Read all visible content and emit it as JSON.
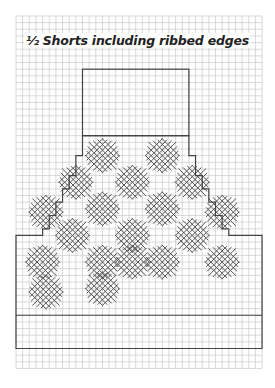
{
  "title": "½ Shorts including ribbed edges",
  "colors": {
    "grid": "#c8c8c8",
    "outline": "#444444",
    "motif": "#555555",
    "background": "#ffffff"
  },
  "grid": {
    "x0": 16,
    "y0": 16,
    "cols": 37,
    "rows": 53,
    "cell": 6.65
  },
  "outline": {
    "waistband": {
      "c0": 10,
      "r0": 8,
      "c1": 26,
      "r1": 18
    },
    "body_left_steps": [
      [
        10,
        18
      ],
      [
        10,
        21
      ],
      [
        9,
        21
      ],
      [
        9,
        24
      ],
      [
        8,
        24
      ],
      [
        8,
        26
      ],
      [
        7,
        26
      ],
      [
        7,
        28
      ],
      [
        6,
        28
      ],
      [
        6,
        30
      ],
      [
        5,
        30
      ],
      [
        5,
        32
      ],
      [
        4,
        32
      ],
      [
        4,
        33
      ],
      [
        0,
        33
      ]
    ],
    "body_right_steps": [
      [
        26,
        18
      ],
      [
        26,
        21
      ],
      [
        27,
        21
      ],
      [
        27,
        24
      ],
      [
        28,
        24
      ],
      [
        28,
        26
      ],
      [
        29,
        26
      ],
      [
        29,
        28
      ],
      [
        30,
        28
      ],
      [
        30,
        30
      ],
      [
        31,
        30
      ],
      [
        31,
        32
      ],
      [
        32,
        32
      ],
      [
        32,
        33
      ],
      [
        37,
        33
      ]
    ],
    "rib_top_row": 45,
    "bottom_row": 50
  },
  "motifs": [
    {
      "c": 13,
      "r": 21
    },
    {
      "c": 22,
      "r": 21
    },
    {
      "c": 9,
      "r": 25
    },
    {
      "c": 17.5,
      "r": 25
    },
    {
      "c": 26.5,
      "r": 25
    },
    {
      "c": 4.5,
      "r": 29.5
    },
    {
      "c": 13,
      "r": 29
    },
    {
      "c": 22,
      "r": 29
    },
    {
      "c": 31,
      "r": 29.5
    },
    {
      "c": 8.5,
      "r": 33
    },
    {
      "c": 17.5,
      "r": 33
    },
    {
      "c": 26.5,
      "r": 33
    },
    {
      "c": 13,
      "r": 37
    },
    {
      "c": 22,
      "r": 37
    },
    {
      "c": 31,
      "r": 37
    },
    {
      "c": 4,
      "r": 37
    },
    {
      "c": 4.5,
      "r": 41.5
    },
    {
      "c": 13,
      "r": 41
    },
    {
      "c": 17.5,
      "r": 37
    }
  ]
}
